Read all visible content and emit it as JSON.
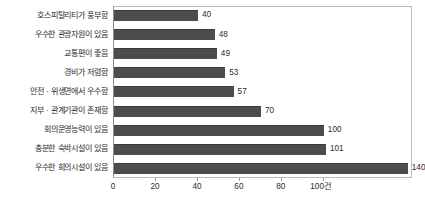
{
  "chart_data": {
    "type": "bar",
    "orientation": "horizontal",
    "title": "",
    "xlabel": "",
    "ylabel": "",
    "unit_suffix": "건",
    "categories": [
      "호스피탈리티가 풍부함",
      "우수한 관광자원이 있음",
      "교통편이 좋음",
      "경비가 저렴함",
      "안전 · 위생면에서 우수함",
      "지부 · 관계기관이 존재함",
      "회의운영능력이 있음",
      "충분한 숙박시설이 있음",
      "우수한 회의시설이 있음"
    ],
    "values": [
      40,
      48,
      49,
      53,
      57,
      70,
      100,
      101,
      140
    ],
    "xlim": [
      0,
      142
    ],
    "xticks": [
      0,
      20,
      40,
      60,
      80,
      100
    ],
    "xticklabels": [
      "0",
      "20",
      "40",
      "60",
      "80",
      "100건"
    ],
    "grid": false,
    "legend": false,
    "bar_color": "#4d4d4d",
    "frame_color": "#bcbcbc",
    "text_color": "#2b2b2b"
  }
}
